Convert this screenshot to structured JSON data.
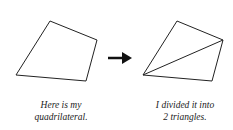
{
  "diagram": {
    "left_caption": [
      "Here is my",
      "quadrilateral."
    ],
    "right_caption": [
      "I divided it into",
      "2 triangles."
    ],
    "arrow_icon": "right-arrow-icon",
    "stroke_color": "#222222",
    "left_shape": "quadrilateral",
    "right_shape": "quadrilateral divided by a diagonal into 2 triangles"
  }
}
